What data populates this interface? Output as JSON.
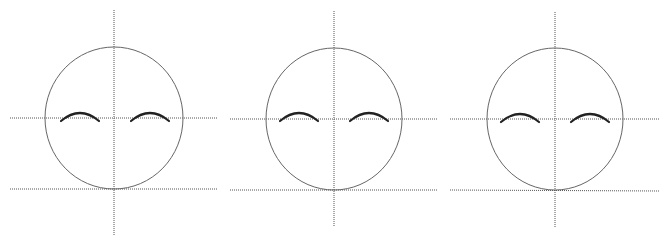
{
  "diagram": {
    "colors": {
      "guide": "#555555",
      "face": "#666666",
      "brow": "#222222",
      "background": "#ffffff"
    },
    "panels": [
      {
        "id": "panel-1",
        "circle": {
          "cx": 114,
          "cy": 118,
          "rx": 69,
          "ry": 71
        },
        "vertical_guide": {
          "x": 114,
          "y1": 10,
          "y2": 235
        },
        "horizontal_guide": {
          "y": 118,
          "x1": 10,
          "x2": 218
        },
        "bottom_guide": {
          "y1": 189,
          "y2": 189,
          "x1": 10,
          "x2": 218
        },
        "brows": [
          {
            "x1": 61,
            "x2": 99,
            "y_end": 121,
            "y_peak": 113
          },
          {
            "x1": 131,
            "x2": 169,
            "y_end": 121,
            "y_peak": 113
          }
        ]
      },
      {
        "id": "panel-2",
        "circle": {
          "cx": 334,
          "cy": 119,
          "rx": 68,
          "ry": 71
        },
        "vertical_guide": {
          "x": 334,
          "y1": 11,
          "y2": 226
        },
        "horizontal_guide": {
          "y": 119,
          "x1": 230,
          "x2": 438
        },
        "bottom_guide": {
          "y1": 190,
          "y2": 190,
          "x1": 230,
          "x2": 438
        },
        "brows": [
          {
            "x1": 280,
            "x2": 318,
            "y_end": 121,
            "y_peak": 113
          },
          {
            "x1": 350,
            "x2": 388,
            "y_end": 121,
            "y_peak": 113
          }
        ]
      },
      {
        "id": "panel-3",
        "circle": {
          "cx": 555,
          "cy": 119,
          "rx": 68,
          "ry": 71
        },
        "vertical_guide": {
          "x": 555,
          "y1": 12,
          "y2": 227
        },
        "horizontal_guide": {
          "y": 119,
          "x1": 450,
          "x2": 659
        },
        "bottom_guide": {
          "y1": 190,
          "y2": 191,
          "x1": 450,
          "x2": 659
        },
        "brows": [
          {
            "x1": 501,
            "x2": 539,
            "y_end": 122,
            "y_peak": 114
          },
          {
            "x1": 571,
            "x2": 609,
            "y_end": 122,
            "y_peak": 114
          }
        ]
      }
    ]
  }
}
